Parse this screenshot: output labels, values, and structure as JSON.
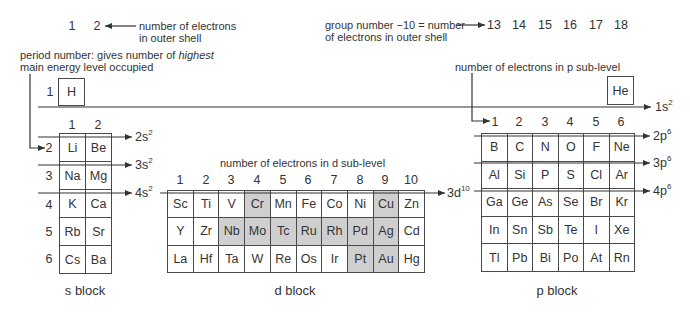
{
  "top_annotations": {
    "outer_shell_groups": [
      "1",
      "2"
    ],
    "outer_shell_label": [
      "number of electrons",
      "in outer shell"
    ],
    "period_label": {
      "line1_prefix": "period number: gives number of ",
      "line1_emphasis": "highest",
      "line2": "main energy level occupied"
    },
    "group_label": [
      "group number −10 = number",
      "of electrons in outer shell"
    ],
    "group_numbers": [
      "13",
      "14",
      "15",
      "16",
      "17",
      "18"
    ],
    "p_sublevel_label": "number of electrons in p sub-level",
    "d_sublevel_label": "number of electrons in d sub-level"
  },
  "period_1": {
    "number": "1",
    "elements": [
      "H",
      "He"
    ],
    "orbital": {
      "base": "1s",
      "sup": "2"
    }
  },
  "s_block": {
    "label": "s block",
    "column_headers": [
      "1",
      "2"
    ],
    "period_numbers": [
      "2",
      "3",
      "4",
      "5",
      "6"
    ],
    "rows": [
      [
        {
          "symbol": "Li",
          "shaded": false
        },
        {
          "symbol": "Be",
          "shaded": false
        }
      ],
      [
        {
          "symbol": "Na",
          "shaded": false
        },
        {
          "symbol": "Mg",
          "shaded": false
        }
      ],
      [
        {
          "symbol": "K",
          "shaded": false
        },
        {
          "symbol": "Ca",
          "shaded": false
        }
      ],
      [
        {
          "symbol": "Rb",
          "shaded": false
        },
        {
          "symbol": "Sr",
          "shaded": false
        }
      ],
      [
        {
          "symbol": "Cs",
          "shaded": false
        },
        {
          "symbol": "Ba",
          "shaded": false
        }
      ]
    ],
    "orbitals": [
      {
        "base": "2s",
        "sup": "2"
      },
      {
        "base": "3s",
        "sup": "2"
      },
      {
        "base": "4s",
        "sup": "2"
      }
    ]
  },
  "d_block": {
    "label": "d block",
    "column_headers": [
      "1",
      "2",
      "3",
      "4",
      "5",
      "6",
      "7",
      "8",
      "9",
      "10"
    ],
    "rows": [
      [
        {
          "symbol": "Sc",
          "shaded": false
        },
        {
          "symbol": "Ti",
          "shaded": false
        },
        {
          "symbol": "V",
          "shaded": false
        },
        {
          "symbol": "Cr",
          "shaded": true
        },
        {
          "symbol": "Mn",
          "shaded": false
        },
        {
          "symbol": "Fe",
          "shaded": false
        },
        {
          "symbol": "Co",
          "shaded": false
        },
        {
          "symbol": "Ni",
          "shaded": false
        },
        {
          "symbol": "Cu",
          "shaded": true
        },
        {
          "symbol": "Zn",
          "shaded": false
        }
      ],
      [
        {
          "symbol": "Y",
          "shaded": false
        },
        {
          "symbol": "Zr",
          "shaded": false
        },
        {
          "symbol": "Nb",
          "shaded": true
        },
        {
          "symbol": "Mo",
          "shaded": true
        },
        {
          "symbol": "Tc",
          "shaded": true
        },
        {
          "symbol": "Ru",
          "shaded": true
        },
        {
          "symbol": "Rh",
          "shaded": true
        },
        {
          "symbol": "Pd",
          "shaded": true
        },
        {
          "symbol": "Ag",
          "shaded": true
        },
        {
          "symbol": "Cd",
          "shaded": false
        }
      ],
      [
        {
          "symbol": "La",
          "shaded": false
        },
        {
          "symbol": "Hf",
          "shaded": false
        },
        {
          "symbol": "Ta",
          "shaded": false
        },
        {
          "symbol": "W",
          "shaded": false
        },
        {
          "symbol": "Re",
          "shaded": false
        },
        {
          "symbol": "Os",
          "shaded": false
        },
        {
          "symbol": "Ir",
          "shaded": false
        },
        {
          "symbol": "Pt",
          "shaded": true
        },
        {
          "symbol": "Au",
          "shaded": true
        },
        {
          "symbol": "Hg",
          "shaded": false
        }
      ]
    ],
    "orbital": {
      "base": "3d",
      "sup": "10"
    }
  },
  "p_block": {
    "label": "p block",
    "column_headers": [
      "1",
      "2",
      "3",
      "4",
      "5",
      "6"
    ],
    "rows": [
      [
        {
          "symbol": "B",
          "shaded": false
        },
        {
          "symbol": "C",
          "shaded": false
        },
        {
          "symbol": "N",
          "shaded": false
        },
        {
          "symbol": "O",
          "shaded": false
        },
        {
          "symbol": "F",
          "shaded": false
        },
        {
          "symbol": "Ne",
          "shaded": false
        }
      ],
      [
        {
          "symbol": "Al",
          "shaded": false
        },
        {
          "symbol": "Si",
          "shaded": false
        },
        {
          "symbol": "P",
          "shaded": false
        },
        {
          "symbol": "S",
          "shaded": false
        },
        {
          "symbol": "Cl",
          "shaded": false
        },
        {
          "symbol": "Ar",
          "shaded": false
        }
      ],
      [
        {
          "symbol": "Ga",
          "shaded": false
        },
        {
          "symbol": "Ge",
          "shaded": false
        },
        {
          "symbol": "As",
          "shaded": false
        },
        {
          "symbol": "Se",
          "shaded": false
        },
        {
          "symbol": "Br",
          "shaded": false
        },
        {
          "symbol": "Kr",
          "shaded": false
        }
      ],
      [
        {
          "symbol": "In",
          "shaded": false
        },
        {
          "symbol": "Sn",
          "shaded": false
        },
        {
          "symbol": "Sb",
          "shaded": false
        },
        {
          "symbol": "Te",
          "shaded": false
        },
        {
          "symbol": "I",
          "shaded": false
        },
        {
          "symbol": "Xe",
          "shaded": false
        }
      ],
      [
        {
          "symbol": "Tl",
          "shaded": false
        },
        {
          "symbol": "Pb",
          "shaded": false
        },
        {
          "symbol": "Bi",
          "shaded": false
        },
        {
          "symbol": "Po",
          "shaded": false
        },
        {
          "symbol": "At",
          "shaded": false
        },
        {
          "symbol": "Rn",
          "shaded": false
        }
      ]
    ],
    "orbitals": [
      {
        "base": "2p",
        "sup": "6"
      },
      {
        "base": "3p",
        "sup": "6"
      },
      {
        "base": "4p",
        "sup": "6"
      }
    ]
  },
  "colors": {
    "text": "#333333",
    "line": "#333333",
    "cell_border": "#4a4a4a",
    "shaded_cell": "#cfcfcf",
    "background": "#ffffff"
  }
}
